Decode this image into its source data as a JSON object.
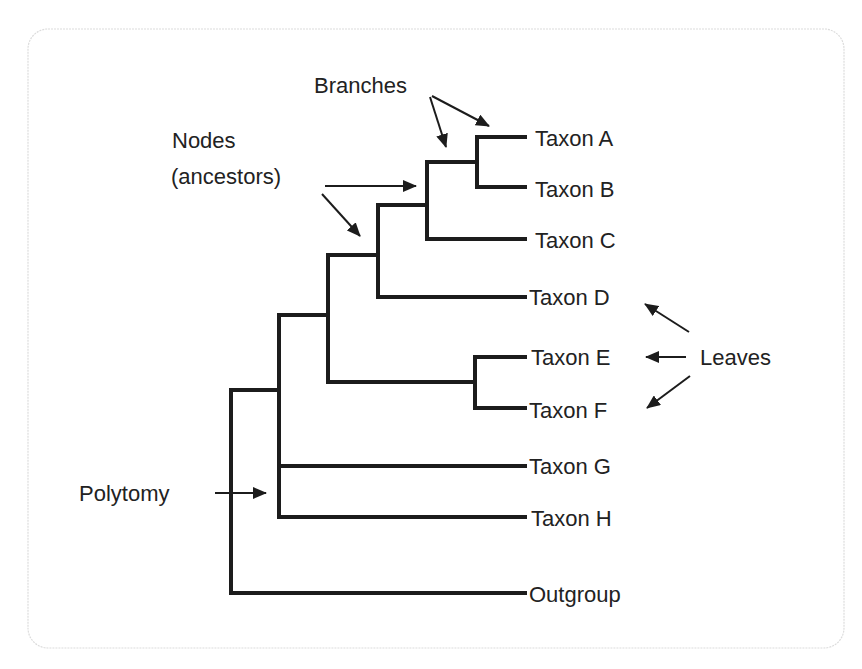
{
  "diagram": {
    "type": "phylogenetic-tree",
    "colors": {
      "line": "#1c1c1c",
      "text": "#222222",
      "border": "#dcdcdc",
      "background": "#ffffff"
    },
    "annotations": {
      "branches": "Branches",
      "nodes_line1": "Nodes",
      "nodes_line2": "(ancestors)",
      "polytomy": "Polytomy",
      "leaves": "Leaves"
    },
    "taxa": [
      {
        "id": "A",
        "label": "Taxon A"
      },
      {
        "id": "B",
        "label": "Taxon B"
      },
      {
        "id": "C",
        "label": "Taxon C"
      },
      {
        "id": "D",
        "label": "Taxon D"
      },
      {
        "id": "E",
        "label": "Taxon E"
      },
      {
        "id": "F",
        "label": "Taxon F"
      },
      {
        "id": "G",
        "label": "Taxon G"
      },
      {
        "id": "H",
        "label": "Taxon H"
      },
      {
        "id": "outgroup",
        "label": "Outgroup"
      }
    ],
    "topology": "(Outgroup,(Taxon G,Taxon H,((Taxon E,Taxon F),(Taxon D,(Taxon C,(Taxon A,Taxon B))))))"
  }
}
